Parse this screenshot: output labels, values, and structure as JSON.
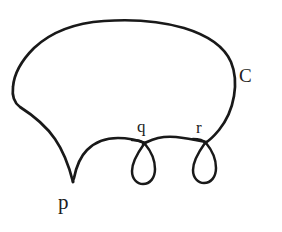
{
  "figure": {
    "background_color": "#ffffff",
    "ink_color": "#191919",
    "width": 282,
    "height": 232,
    "labels": {
      "cusp": "p",
      "loop_left": "q",
      "loop_right": "r",
      "curve": "C"
    },
    "strokes": {
      "outer_curve_width": 2.6,
      "loop_width": 2.5
    },
    "geometry": {
      "cusp_point": "73,182",
      "loop_left_node": "144,144",
      "loop_right_node": "205,143",
      "curve_left_extent": 12,
      "curve_right_extent": 235,
      "curve_top_extent": 21,
      "curve_bottom_extent": 183
    }
  }
}
